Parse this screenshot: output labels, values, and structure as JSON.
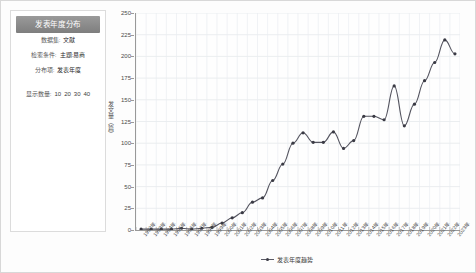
{
  "panel": {
    "title": "发表年度分布",
    "rows": [
      {
        "key": "数据集:",
        "value": "文献"
      },
      {
        "key": "检索条件:",
        "value": "主题:易商"
      },
      {
        "key": "分布项:",
        "value": "发表年度"
      }
    ],
    "count_label": "显示数量:",
    "count_options": [
      "10",
      "20",
      "30",
      "40"
    ]
  },
  "chart_data": {
    "type": "line",
    "title": "发表年度分布",
    "xlabel": "",
    "ylabel": "发文量（篇）",
    "legend": [
      "发表年度趋势"
    ],
    "legend_position": "bottom",
    "grid": true,
    "ylim": [
      0,
      250
    ],
    "yticks": [
      250,
      225,
      200,
      175,
      150,
      125,
      100,
      75,
      50,
      25,
      0
    ],
    "categories": [
      "1992年",
      "1993年",
      "1994年",
      "1995年",
      "1996年",
      "1997年",
      "1998年",
      "1999年",
      "2000年",
      "2001年",
      "2002年",
      "2003年",
      "2004年",
      "2005年",
      "2006年",
      "2007年",
      "2008年",
      "2009年",
      "2010年",
      "2011年",
      "2012年",
      "2013年",
      "2014年",
      "2015年",
      "2016年",
      "2017年",
      "2018年",
      "2019年",
      "2020年",
      "2021年",
      "2022年",
      "2023年"
    ],
    "values": [
      1,
      1,
      1,
      1,
      2,
      1,
      2,
      3,
      8,
      14,
      20,
      32,
      37,
      57,
      76,
      100,
      112,
      101,
      101,
      113,
      94,
      103,
      131,
      131,
      127,
      166,
      120,
      145,
      172,
      193,
      219,
      203
    ]
  }
}
